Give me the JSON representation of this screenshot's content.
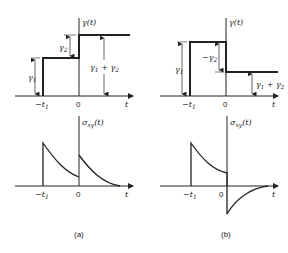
{
  "figure": {
    "panels": [
      {
        "id": "a",
        "caption": "(a)",
        "strain_plot": {
          "ylabel": "γ(t)",
          "xlabel": "t",
          "ticks": [
            "−t1",
            "0"
          ],
          "annotations": [
            "γ1",
            "γ2",
            "γ1 + γ2"
          ],
          "description": "Step strain γ1 applied at −t1, second step γ2 at 0; total γ1 + γ2"
        },
        "stress_plot": {
          "ylabel": "σxy(t)",
          "xlabel": "t",
          "ticks": [
            "−t1",
            "0"
          ],
          "description": "Stress jumps at −t1 and decays; jumps again at 0 and decays to zero"
        }
      },
      {
        "id": "b",
        "caption": "(b)",
        "strain_plot": {
          "ylabel": "γ(t)",
          "xlabel": "t",
          "ticks": [
            "−t1",
            "0"
          ],
          "annotations": [
            "γ1",
            "−γ2",
            "γ1 + γ2"
          ],
          "description": "Step strain γ1 at −t1, then reverse step −γ2 at 0; remaining γ1 + γ2"
        },
        "stress_plot": {
          "ylabel": "σxy(t)",
          "xlabel": "t",
          "ticks": [
            "−t1",
            "0"
          ],
          "description": "Stress jumps at −t1 and decays; at 0 drops negative then relaxes toward zero"
        }
      }
    ]
  },
  "labels": {
    "gamma_t": "γ(t)",
    "sigma": "σ",
    "sigma_sub": "xy",
    "sigma_arg": "(t)",
    "t": "t",
    "zero": "0",
    "minus_t": "−t",
    "sub1": "1",
    "gamma": "γ",
    "g1_sub": "1",
    "g2_sub": "2",
    "minus_gamma": "−γ",
    "plus": " + γ",
    "cap_a": "(a)",
    "cap_b": "(b)"
  }
}
